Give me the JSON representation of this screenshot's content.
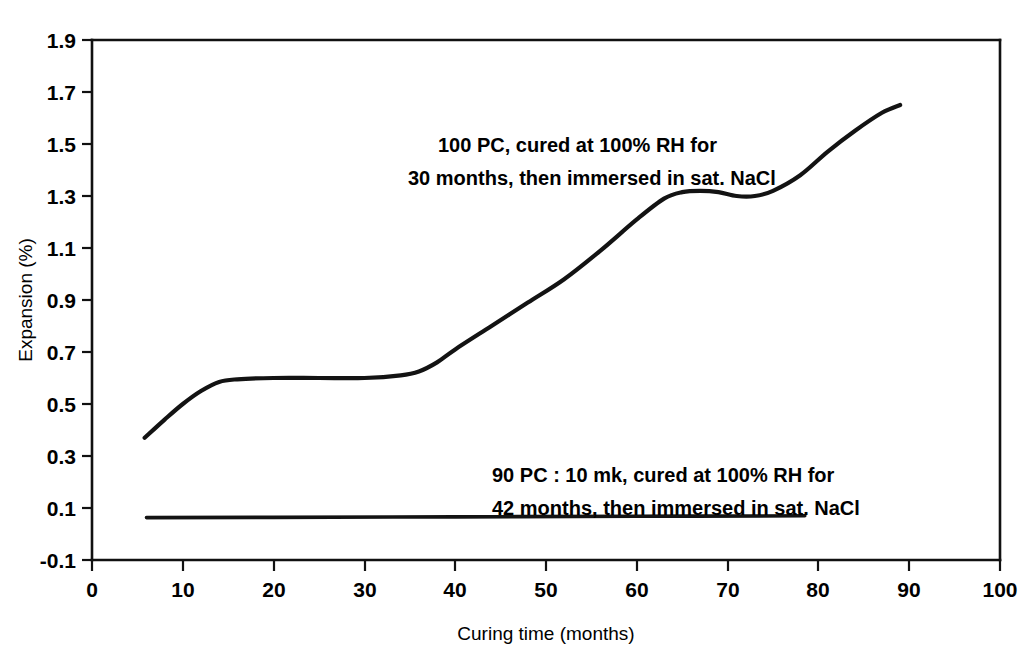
{
  "chart_data": {
    "type": "line",
    "title": "",
    "xlabel": "Curing time (months)",
    "ylabel": "Expansion (%)",
    "xlim": [
      0,
      100
    ],
    "ylim": [
      -0.1,
      1.9
    ],
    "grid": false,
    "legend": "none",
    "x_ticks": [
      "0",
      "10",
      "20",
      "30",
      "40",
      "50",
      "60",
      "70",
      "80",
      "90",
      "100"
    ],
    "x_tick_values": [
      0,
      10,
      20,
      30,
      40,
      50,
      60,
      70,
      80,
      90,
      100
    ],
    "y_ticks": [
      "-0.1",
      "0.1",
      "0.3",
      "0.5",
      "0.7",
      "0.9",
      "1.1",
      "1.3",
      "1.5",
      "1.7",
      "1.9"
    ],
    "y_tick_values": [
      -0.1,
      0.1,
      0.3,
      0.5,
      0.7,
      0.9,
      1.1,
      1.3,
      1.5,
      1.7,
      1.9
    ],
    "series": [
      {
        "name": "100 PC, cured at 100% RH for 30 months, then immersed in sat. NaCl",
        "x": [
          5.8,
          8,
          10,
          12,
          14,
          16,
          20,
          25,
          30,
          34,
          36,
          38,
          40,
          44,
          48,
          52,
          56,
          60,
          63,
          65,
          67,
          69,
          71,
          73,
          75,
          78,
          81,
          84,
          87,
          89
        ],
        "y": [
          0.37,
          0.44,
          0.5,
          0.55,
          0.585,
          0.595,
          0.6,
          0.6,
          0.6,
          0.61,
          0.625,
          0.66,
          0.71,
          0.8,
          0.89,
          0.98,
          1.09,
          1.21,
          1.29,
          1.315,
          1.32,
          1.315,
          1.3,
          1.3,
          1.32,
          1.38,
          1.47,
          1.55,
          1.62,
          1.65
        ]
      },
      {
        "name": "90 PC : 10 mk, cured at 100% RH for 42 months, then immersed in sat. NaCl",
        "x": [
          6.0,
          20,
          40,
          60,
          78.5
        ],
        "y": [
          0.063,
          0.064,
          0.066,
          0.068,
          0.07
        ]
      }
    ],
    "annotations": [
      {
        "id": "annotation-pc-100",
        "line1": "100  PC, cured at 100% RH for",
        "line2": "30 months, then immersed in sat. NaCl",
        "x_px": 438,
        "y_px": 152
      },
      {
        "id": "annotation-pc-90-mk-10",
        "line1": "90 PC : 10  mk, cured at 100% RH for",
        "line2": "42 months, then immersed in sat. NaCl",
        "x_px": 492,
        "y_px": 482
      }
    ],
    "colors": {
      "curve": "#131313",
      "axis": "#111111",
      "background": "#ffffff"
    }
  }
}
